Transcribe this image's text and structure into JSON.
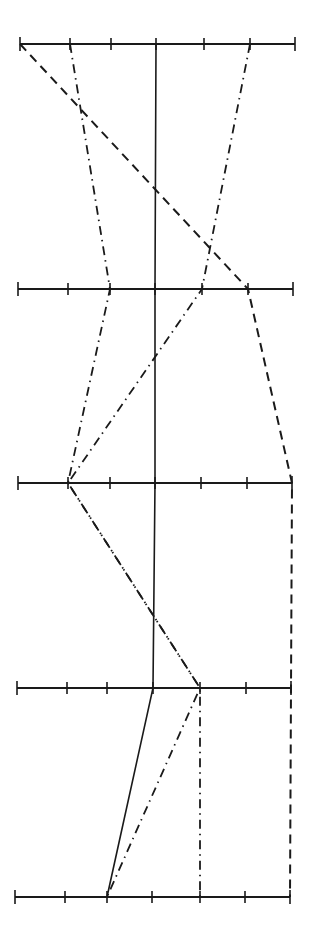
{
  "chart_data": {
    "type": "line",
    "subtype": "parallel-coordinates",
    "title": "",
    "xlabel": "",
    "ylabel": "",
    "grid": false,
    "legend": null,
    "axes": [
      {
        "name": "axis-1",
        "y": 44,
        "x_start": 20,
        "x_end": 295,
        "ticks": [
          20,
          70,
          111,
          156,
          204,
          250,
          295
        ]
      },
      {
        "name": "axis-2",
        "y": 289,
        "x_start": 18,
        "x_end": 293,
        "ticks": [
          18,
          68,
          110,
          155,
          202,
          248,
          293
        ]
      },
      {
        "name": "axis-3",
        "y": 483,
        "x_start": 18,
        "x_end": 292,
        "ticks": [
          18,
          68,
          110,
          155,
          201,
          247,
          292
        ]
      },
      {
        "name": "axis-4",
        "y": 688,
        "x_start": 17,
        "x_end": 291,
        "ticks": [
          17,
          67,
          107,
          153,
          200,
          246,
          291
        ]
      },
      {
        "name": "axis-5",
        "y": 897,
        "x_start": 15,
        "x_end": 290,
        "ticks": [
          15,
          65,
          107,
          152,
          200,
          245,
          290
        ]
      }
    ],
    "tick_positions": [
      0,
      1,
      2,
      3,
      4,
      5,
      6
    ],
    "series": [
      {
        "name": "solid",
        "style": "solid",
        "values": [
          3,
          3,
          3,
          3,
          2
        ]
      },
      {
        "name": "dashed",
        "style": "dashed",
        "values": [
          0,
          5,
          6,
          6,
          6
        ]
      },
      {
        "name": "dash-dot-a",
        "style": "dash-dot",
        "values": [
          1,
          2,
          1,
          4,
          2
        ]
      },
      {
        "name": "dash-dot-b",
        "style": "dash-dot",
        "values": [
          5,
          4,
          1,
          4,
          4
        ]
      }
    ],
    "colors": {
      "line": "#1a1a1a",
      "background": "#ffffff"
    }
  }
}
